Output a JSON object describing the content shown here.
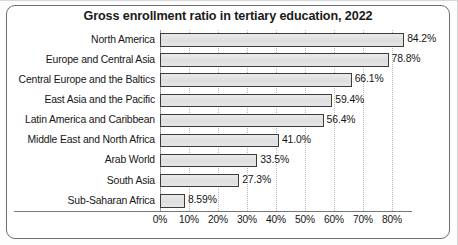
{
  "chart_data": {
    "type": "bar",
    "orientation": "horizontal",
    "title": "Gross enrollment ratio in tertiary education, 2022",
    "xlabel": "",
    "ylabel": "",
    "xlim": [
      0,
      86.9
    ],
    "grid": true,
    "legend": "none",
    "categories": [
      "North America",
      "Europe and Central Asia",
      "Central Europe and the Baltics",
      "East Asia and the Pacific",
      "Latin America and Caribbean",
      "Middle East and North Africa",
      "Arab World",
      "South Asia",
      "Sub-Saharan Africa"
    ],
    "values": [
      84.2,
      78.8,
      66.1,
      59.4,
      56.4,
      41.0,
      33.5,
      27.3,
      8.59
    ],
    "value_labels": [
      "84.2%",
      "78.8%",
      "66.1%",
      "59.4%",
      "56.4%",
      "41.0%",
      "33.5%",
      "27.3%",
      "8.59%"
    ],
    "xticks": [
      0,
      10,
      20,
      30,
      40,
      50,
      60,
      70,
      80
    ],
    "xtick_labels": [
      "0%",
      "10%",
      "20%",
      "30%",
      "40%",
      "50%",
      "60%",
      "70%",
      "80%"
    ],
    "bar_fill": "#e3e3e3",
    "bar_border": "#3c3c3c",
    "grid_color": "#b9b9b9",
    "text_color": "#161616"
  }
}
